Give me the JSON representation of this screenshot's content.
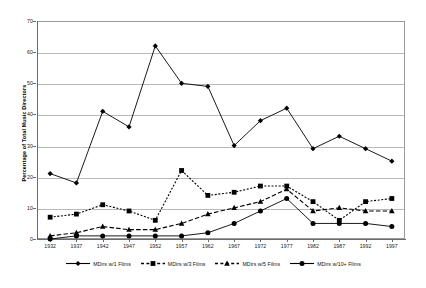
{
  "chart_data": {
    "type": "line",
    "title": "",
    "xlabel": "",
    "ylabel": "Percentage of Total Music Directors",
    "x": [
      1932,
      1937,
      1942,
      1947,
      1952,
      1957,
      1962,
      1967,
      1972,
      1977,
      1982,
      1987,
      1992,
      1997
    ],
    "categories": [
      "1932",
      "1937",
      "1942",
      "1947",
      "1952",
      "1957",
      "1962",
      "1967",
      "1972",
      "1977",
      "1982",
      "1987",
      "1992",
      "1997"
    ],
    "ylim": [
      0,
      70
    ],
    "yticks": [
      0,
      10,
      20,
      30,
      40,
      50,
      60,
      70
    ],
    "ytick_labels": [
      "0",
      "10",
      "20",
      "30",
      "40",
      "50",
      "60",
      "70"
    ],
    "grid": true,
    "legend_position": "bottom",
    "series": [
      {
        "name": "MDirs w/1 Films",
        "marker": "diamond",
        "line_style": "solid",
        "color": "#000000",
        "values": [
          21,
          18,
          41,
          36,
          62,
          50,
          49,
          30,
          38,
          42,
          29,
          33,
          29,
          25
        ]
      },
      {
        "name": "MDirs w/3 Films",
        "marker": "square",
        "line_style": "dotted",
        "color": "#000000",
        "values": [
          7,
          8,
          11,
          9,
          6,
          22,
          14,
          15,
          17,
          17,
          12,
          6,
          12,
          13
        ]
      },
      {
        "name": "MDirs w/5 Films",
        "marker": "triangle",
        "line_style": "dashed",
        "color": "#000000",
        "values": [
          1,
          2,
          4,
          3,
          3,
          5,
          8,
          10,
          12,
          16,
          9,
          10,
          9,
          9
        ]
      },
      {
        "name": "MDirs w/10+ Films",
        "marker": "circle",
        "line_style": "solid",
        "color": "#000000",
        "values": [
          0,
          1,
          1,
          1,
          1,
          1,
          2,
          5,
          9,
          13,
          5,
          5,
          5,
          4
        ]
      }
    ]
  },
  "axis": {
    "y_title": "Percentage of Total Music Directors"
  }
}
